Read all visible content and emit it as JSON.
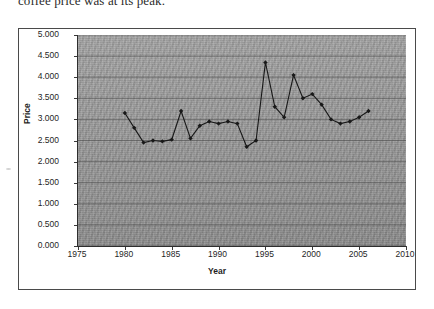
{
  "caption": {
    "text": "coffee price was at its peak."
  },
  "axis_titles": {
    "x": "Year",
    "y": "Price"
  },
  "chart_data": {
    "type": "line",
    "title": "",
    "xlabel": "Year",
    "ylabel": "Price",
    "xlim": [
      1975,
      2010
    ],
    "ylim": [
      0.0,
      5.0
    ],
    "grid": true,
    "legend": false,
    "plot_background": "#9a9a9a",
    "line_color": "#181818",
    "marker": "filled-diamond",
    "xticks": [
      1975,
      1980,
      1985,
      1990,
      1995,
      2000,
      2005,
      2010
    ],
    "xtick_labels": [
      "1975",
      "1980",
      "1985",
      "1990",
      "1995",
      "2000",
      "2005",
      "2010"
    ],
    "yticks": [
      0.0,
      0.5,
      1.0,
      1.5,
      2.0,
      2.5,
      3.0,
      3.5,
      4.0,
      4.5,
      5.0
    ],
    "ytick_labels": [
      "0.000",
      "0.500",
      "1.000",
      "1.500",
      "2.000",
      "2.500",
      "3.000",
      "3.500",
      "4.000",
      "4.500",
      "5.000"
    ],
    "x": [
      1980,
      1981,
      1982,
      1983,
      1984,
      1985,
      1986,
      1987,
      1988,
      1989,
      1990,
      1991,
      1992,
      1993,
      1994,
      1995,
      1996,
      1997,
      1998,
      1999,
      2000,
      2001,
      2002,
      2003,
      2004,
      2005,
      2006
    ],
    "values": [
      3.15,
      2.8,
      2.45,
      2.5,
      2.48,
      2.52,
      3.2,
      2.55,
      2.85,
      2.95,
      2.9,
      2.95,
      2.9,
      2.35,
      2.5,
      4.35,
      3.3,
      3.05,
      4.05,
      3.5,
      3.6,
      3.35,
      3.0,
      2.9,
      2.95,
      3.05,
      3.2
    ],
    "series_name": "Price"
  }
}
